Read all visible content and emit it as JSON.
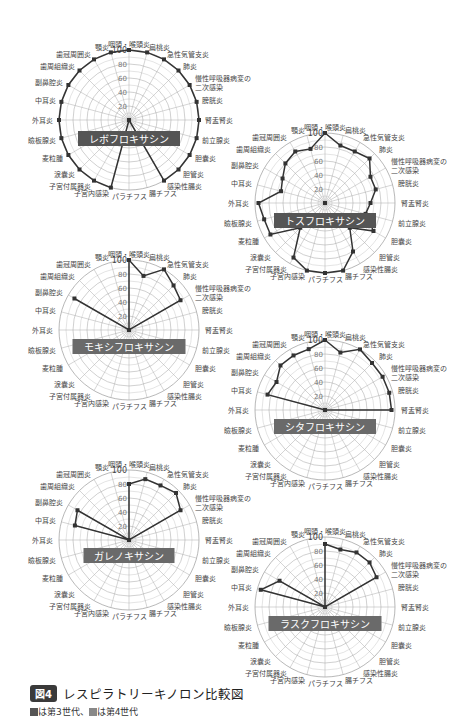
{
  "figure": {
    "badge": "図4",
    "title": "レスピラトリーキノロン比較図",
    "legend": {
      "gen3_label": "は第3世代",
      "separator": "、",
      "gen4_label": "は第4世代"
    }
  },
  "chart_data": [
    {
      "type": "radar",
      "title": "レボフロキサシン",
      "generation": 3,
      "categories": [
        "咽頭・喉頭炎",
        "扁桃炎",
        "急性気管支炎",
        "肺炎",
        "慢性呼吸器病変の二次感染",
        "膀胱炎",
        "腎盂腎炎",
        "前立腺炎",
        "胆嚢炎",
        "胆管炎",
        "感染性腸炎",
        "腸チフス",
        "パラチフス",
        "子宮内感染",
        "子宮付属器炎",
        "涙嚢炎",
        "麦粒腫",
        "瞼板腺炎",
        "外耳炎",
        "中耳炎",
        "副鼻腔炎",
        "歯周組織炎",
        "歯冠周囲炎",
        "顎炎"
      ],
      "values": [
        100,
        100,
        100,
        100,
        100,
        100,
        100,
        100,
        100,
        100,
        100,
        0,
        0,
        100,
        100,
        100,
        100,
        100,
        100,
        100,
        100,
        100,
        100,
        100
      ],
      "rlim": [
        0,
        100
      ],
      "ticks": [
        20,
        40,
        60,
        80,
        100
      ]
    },
    {
      "type": "radar",
      "title": "トスフロキサシン",
      "generation": 3,
      "categories": [
        "咽頭・喉頭炎",
        "扁桃炎",
        "急性気管支炎",
        "肺炎",
        "慢性呼吸器病変の二次感染",
        "膀胱炎",
        "腎盂腎炎",
        "前立腺炎",
        "胆嚢炎",
        "胆管炎",
        "感染性腸炎",
        "腸チフス",
        "パラチフス",
        "子宮内感染",
        "子宮付属器炎",
        "涙嚢炎",
        "麦粒腫",
        "瞼板腺炎",
        "外耳炎",
        "中耳炎",
        "副鼻腔炎",
        "歯周組織炎",
        "歯冠周囲炎",
        "顎炎"
      ],
      "values": [
        100,
        85,
        85,
        90,
        75,
        75,
        65,
        60,
        80,
        50,
        80,
        100,
        100,
        100,
        90,
        50,
        90,
        90,
        95,
        65,
        70,
        80,
        85,
        80
      ],
      "rlim": [
        0,
        100
      ],
      "ticks": [
        20,
        40,
        60,
        80,
        100
      ]
    },
    {
      "type": "radar",
      "title": "モキシフロキサシン",
      "generation": 4,
      "categories": [
        "咽頭・喉頭炎",
        "扁桃炎",
        "急性気管支炎",
        "肺炎",
        "慢性呼吸器病変の二次感染",
        "膀胱炎",
        "腎盂腎炎",
        "前立腺炎",
        "胆嚢炎",
        "胆管炎",
        "感染性腸炎",
        "腸チフス",
        "パラチフス",
        "子宮内感染",
        "子宮付属器炎",
        "涙嚢炎",
        "麦粒腫",
        "瞼板腺炎",
        "外耳炎",
        "中耳炎",
        "副鼻腔炎",
        "歯周組織炎",
        "歯冠周囲炎",
        "顎炎"
      ],
      "values": [
        100,
        80,
        100,
        90,
        85,
        0,
        0,
        0,
        0,
        0,
        0,
        0,
        0,
        0,
        0,
        0,
        0,
        0,
        0,
        0,
        90,
        0,
        0,
        0
      ],
      "rlim": [
        0,
        100
      ],
      "ticks": [
        20,
        40,
        60,
        80,
        100
      ]
    },
    {
      "type": "radar",
      "title": "シタフロキサシン",
      "generation": 4,
      "categories": [
        "咽頭・喉頭炎",
        "扁桃炎",
        "急性気管支炎",
        "肺炎",
        "慢性呼吸器病変の二次感染",
        "膀胱炎",
        "腎盂腎炎",
        "前立腺炎",
        "胆嚢炎",
        "胆管炎",
        "感染性腸炎",
        "腸チフス",
        "パラチフス",
        "子宮内感染",
        "子宮付属器炎",
        "涙嚢炎",
        "麦粒腫",
        "瞼板腺炎",
        "外耳炎",
        "中耳炎",
        "副鼻腔炎",
        "歯周組織炎",
        "歯冠周囲炎",
        "顎炎"
      ],
      "values": [
        100,
        85,
        100,
        95,
        95,
        95,
        95,
        0,
        0,
        0,
        0,
        0,
        0,
        0,
        0,
        0,
        0,
        0,
        0,
        85,
        80,
        90,
        90,
        90
      ],
      "rlim": [
        0,
        100
      ],
      "ticks": [
        20,
        40,
        60,
        80,
        100
      ]
    },
    {
      "type": "radar",
      "title": "ガレノキサシン",
      "generation": 4,
      "categories": [
        "咽頭・喉頭炎",
        "扁桃炎",
        "急性気管支炎",
        "肺炎",
        "慢性呼吸器病変の二次感染",
        "膀胱炎",
        "腎盂腎炎",
        "前立腺炎",
        "胆嚢炎",
        "胆管炎",
        "感染性腸炎",
        "腸チフス",
        "パラチフス",
        "子宮内感染",
        "子宮付属器炎",
        "涙嚢炎",
        "麦粒腫",
        "瞼板腺炎",
        "外耳炎",
        "中耳炎",
        "副鼻腔炎",
        "歯周組織炎",
        "歯冠周囲炎",
        "顎炎"
      ],
      "values": [
        80,
        90,
        90,
        95,
        85,
        0,
        0,
        0,
        0,
        0,
        0,
        0,
        0,
        0,
        0,
        0,
        0,
        0,
        0,
        80,
        85,
        0,
        0,
        0
      ],
      "rlim": [
        0,
        100
      ],
      "ticks": [
        20,
        40,
        60,
        80,
        100
      ]
    },
    {
      "type": "radar",
      "title": "ラスクフロキサシン",
      "generation": 4,
      "categories": [
        "咽頭・喉頭炎",
        "扁桃炎",
        "急性気管支炎",
        "肺炎",
        "慢性呼吸器病変の二次感染",
        "膀胱炎",
        "腎盂腎炎",
        "前立腺炎",
        "胆嚢炎",
        "胆管炎",
        "感染性腸炎",
        "腸チフス",
        "パラチフス",
        "子宮内感染",
        "子宮付属器炎",
        "涙嚢炎",
        "麦粒腫",
        "瞼板腺炎",
        "外耳炎",
        "中耳炎",
        "副鼻腔炎",
        "歯周組織炎",
        "歯冠周囲炎",
        "顎炎"
      ],
      "values": [
        90,
        85,
        90,
        90,
        85,
        0,
        0,
        0,
        0,
        0,
        0,
        0,
        0,
        0,
        0,
        0,
        0,
        0,
        0,
        95,
        75,
        0,
        0,
        0
      ],
      "rlim": [
        0,
        100
      ],
      "ticks": [
        20,
        40,
        60,
        80,
        100
      ]
    }
  ],
  "layout": {
    "charts": [
      {
        "cx": 129,
        "cy": 120,
        "r": 70,
        "label_y": 140
      },
      {
        "cx": 325,
        "cy": 203,
        "r": 70,
        "label_y": 222
      },
      {
        "cx": 129,
        "cy": 330,
        "r": 70,
        "label_y": 348
      },
      {
        "cx": 325,
        "cy": 410,
        "r": 70,
        "label_y": 428
      },
      {
        "cx": 129,
        "cy": 540,
        "r": 70,
        "label_y": 557
      },
      {
        "cx": 325,
        "cy": 607,
        "r": 70,
        "label_y": 625
      }
    ]
  }
}
